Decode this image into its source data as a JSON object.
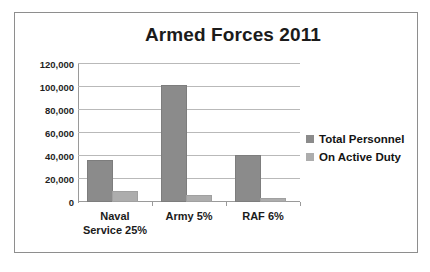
{
  "chart_data": {
    "type": "bar",
    "title": "Armed Forces 2011",
    "xlabel": "",
    "ylabel": "",
    "categories": [
      "Naval Service 25%",
      "Army 5%",
      "RAF 6%"
    ],
    "category_lines": [
      [
        "Naval",
        "Service 25%"
      ],
      [
        "Army 5%"
      ],
      [
        "RAF 6%"
      ]
    ],
    "series": [
      {
        "name": "Total Personnel",
        "values": [
          35000,
          100000,
          39000
        ],
        "color": "#8b8b8b"
      },
      {
        "name": "On Active Duty",
        "values": [
          8000,
          4000,
          1500
        ],
        "color": "#adadad"
      }
    ],
    "ylim": [
      0,
      120000
    ],
    "ytick_labels": [
      "120,000",
      "100,000",
      "80,000",
      "60,000",
      "40,000",
      "20,000",
      "0"
    ],
    "ytick_values": [
      120000,
      100000,
      80000,
      60000,
      40000,
      20000,
      0
    ],
    "grid": true,
    "legend_position": "right"
  },
  "legend": {
    "items": [
      {
        "label": "Total Personnel"
      },
      {
        "label": "On Active Duty"
      }
    ]
  },
  "colors": {
    "total_personnel": "#8b8b8b",
    "on_active_duty": "#adadad",
    "gridline": "#b9b9b9",
    "axis": "#9a9a9a",
    "border": "#8e8e8e",
    "text": "#1b1b1b",
    "background": "#ffffff"
  }
}
